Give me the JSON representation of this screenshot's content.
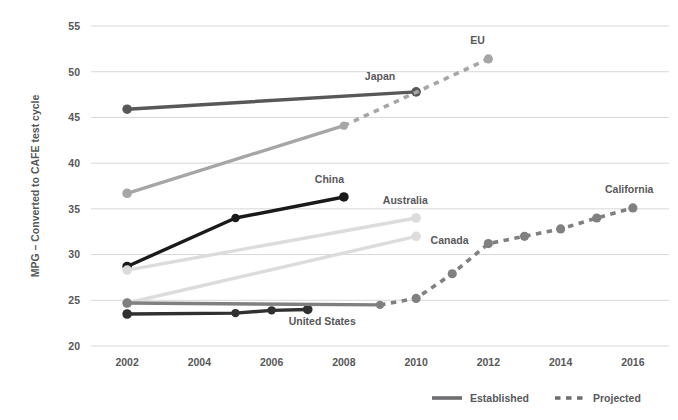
{
  "chart_data": {
    "type": "line",
    "title": "",
    "subtitle": "",
    "xlabel": "",
    "ylabel": "MPG – Converted to CAFE test cycle",
    "xlim": [
      2001,
      2017
    ],
    "ylim": [
      20,
      55
    ],
    "xticks": [
      "2002",
      "2004",
      "2006",
      "2008",
      "2010",
      "2012",
      "2014",
      "2016"
    ],
    "yticks": [
      "20",
      "25",
      "30",
      "35",
      "40",
      "45",
      "50",
      "55"
    ],
    "grid": "horizontal",
    "legend_position": "bottom-right",
    "legend": [
      {
        "key": "established",
        "label": "Established",
        "style": "solid"
      },
      {
        "key": "projected",
        "label": "Projected",
        "style": "dashed"
      }
    ],
    "series": [
      {
        "name": "Japan",
        "label": "Japan",
        "color": "#58585a",
        "style": "solid",
        "x": [
          2002,
          2010
        ],
        "values": [
          45.9,
          47.8
        ],
        "label_x": 2009.0,
        "label_y": 49.1
      },
      {
        "name": "EU",
        "label": "EU",
        "color": "#a6a6a8",
        "style": "mixed",
        "x": [
          2002,
          2008,
          2012
        ],
        "values": [
          36.7,
          44.1,
          51.4
        ],
        "solid_until": 2008,
        "label_x": 2011.7,
        "label_y": 53.0
      },
      {
        "name": "China",
        "label": "China",
        "color": "#1a1a1a",
        "style": "solid",
        "x": [
          2002,
          2005,
          2008
        ],
        "values": [
          28.7,
          34.0,
          36.3
        ],
        "label_x": 2007.6,
        "label_y": 37.8
      },
      {
        "name": "Australia",
        "label": "Australia",
        "color": "#dcdcdc",
        "style": "solid",
        "x": [
          2002,
          2010
        ],
        "values": [
          28.3,
          34.0
        ],
        "label_x": 2009.7,
        "label_y": 35.5
      },
      {
        "name": "Canada",
        "label": "Canada",
        "color": "#dcdcdc",
        "style": "solid",
        "x": [
          2002,
          2010
        ],
        "values": [
          24.7,
          32.0
        ],
        "label_x": 2010.4,
        "label_y": 31.2
      },
      {
        "name": "United States",
        "label": "United States",
        "color": "#303030",
        "style": "solid",
        "x": [
          2002,
          2005,
          2006,
          2007
        ],
        "values": [
          23.5,
          23.6,
          23.9,
          24.0
        ],
        "label_x": 2007.4,
        "label_y": 22.3
      },
      {
        "name": "California",
        "label": "California",
        "color": "#808080",
        "style": "mixed",
        "x": [
          2002,
          2009,
          2010,
          2011,
          2012,
          2013,
          2014,
          2015,
          2016
        ],
        "values": [
          24.7,
          24.5,
          25.2,
          27.9,
          31.2,
          32.0,
          32.8,
          34.0,
          35.1
        ],
        "solid_until": 2009,
        "label_x": 2015.9,
        "label_y": 36.7
      }
    ]
  },
  "colors": {
    "axis_text": "#58585a",
    "gridline": "#d8d8d8",
    "background": "#ffffff"
  }
}
